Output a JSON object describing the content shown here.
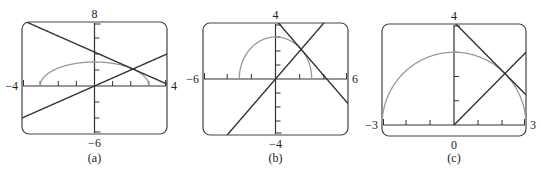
{
  "figure": {
    "panels": [
      {
        "id": "a",
        "caption": "(a)",
        "window": {
          "xmin": -4,
          "xmax": 4,
          "ymin": -6,
          "ymax": 8
        },
        "labels": {
          "xmin": "−4",
          "xmax": "4",
          "ymin": "−6",
          "ymax": "8"
        },
        "box": {
          "left": 22,
          "top": 22,
          "right": 167,
          "bottom": 134
        },
        "xticks": [
          -3,
          -2,
          -1,
          1,
          2,
          3
        ],
        "yticks": [
          -4,
          -2,
          2,
          4,
          6
        ]
      },
      {
        "id": "b",
        "caption": "(b)",
        "window": {
          "xmin": -6,
          "xmax": 6,
          "ymin": -4,
          "ymax": 4
        },
        "labels": {
          "xmin": "−6",
          "xmax": "6",
          "ymin": "−4",
          "ymax": "4"
        },
        "box": {
          "left": 203,
          "top": 23,
          "right": 348,
          "bottom": 135
        },
        "xticks": [
          -4,
          -2,
          2,
          4
        ],
        "yticks": [
          -3,
          -2,
          -1,
          1,
          2,
          3
        ]
      },
      {
        "id": "c",
        "caption": "(c)",
        "window": {
          "xmin": -3,
          "xmax": 3,
          "ymin": 0,
          "ymax": 4
        },
        "labels": {
          "xmin": "−3",
          "xmax": "3",
          "ymin": "0",
          "ymax": "4"
        },
        "box": {
          "left": 382,
          "top": 24,
          "right": 526,
          "bottom": 136
        },
        "xticks": [
          -2,
          -1,
          1,
          2
        ],
        "yticks": [
          1,
          2,
          3
        ]
      }
    ],
    "curves": {
      "semicircle": {
        "equation": "y = sqrt(9 - x^2)",
        "color": "#9a9a9a"
      },
      "line_up": {
        "equation": "y = x",
        "color": "#333333"
      },
      "line_down": {
        "equation": "y = -x + 3*sqrt(2)",
        "color": "#333333"
      }
    },
    "axis_color": "#333333",
    "frame_color": "#444444"
  }
}
